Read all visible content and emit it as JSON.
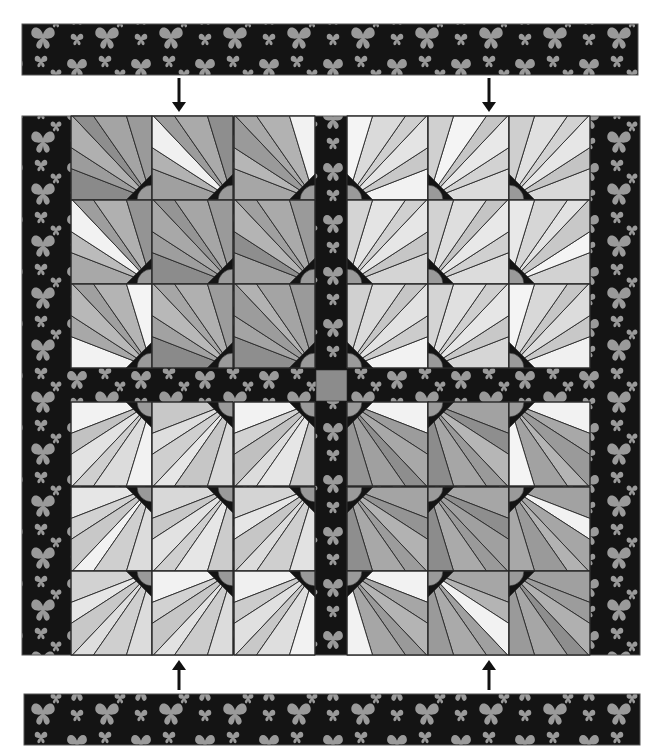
{
  "colors": {
    "background": "#ffffff",
    "fabric_dark": "#141414",
    "butterfly": "#9a9a9a",
    "seam": "#2a2a2a",
    "arrow": "#111111",
    "cornerstone": "#8c8c8c"
  },
  "layout": {
    "top_border_strip": {
      "x": 22,
      "y": 24,
      "w": 616,
      "h": 51
    },
    "bottom_border_strip": {
      "x": 24,
      "y": 694,
      "w": 616,
      "h": 51
    },
    "quilt": {
      "x": 22,
      "y": 116,
      "w": 618,
      "h": 539
    },
    "side_border_left": {
      "x": 22,
      "w": 49
    },
    "side_border_right": {
      "x": 590,
      "w": 50
    },
    "block_cols": [
      71,
      152,
      234,
      347,
      428,
      509
    ],
    "block_rows": [
      116,
      200,
      284,
      402,
      487,
      571
    ],
    "block_w": 81,
    "block_h": 84,
    "vertical_sashing": {
      "x": 315,
      "w": 32
    },
    "horizontal_sashing": {
      "y": 368,
      "h": 34
    },
    "center_cornerstone": {
      "x": 316,
      "y": 370,
      "w": 31,
      "h": 31
    }
  },
  "arrows": [
    {
      "name": "arrow-down-left",
      "direction": "down",
      "x": 179,
      "y1": 78,
      "y2": 112
    },
    {
      "name": "arrow-down-right",
      "direction": "down",
      "x": 489,
      "y1": 78,
      "y2": 112
    },
    {
      "name": "arrow-up-left",
      "direction": "up",
      "x": 179,
      "y1": 690,
      "y2": 660
    },
    {
      "name": "arrow-up-right",
      "direction": "up",
      "x": 489,
      "y1": 690,
      "y2": 660
    }
  ],
  "quadrants": [
    {
      "name": "top-left",
      "origin_corner": "bottom-right",
      "tone": "dark",
      "blocks": [
        [
          "#8a8a8a",
          "#9c9c9c",
          "#b0b0b0",
          "#8e8e8e",
          "#a4a4a4",
          "#9a9a9a"
        ],
        [
          "#a0a0a0",
          "#b2b2b2",
          "#f0f0f0",
          "#9c9c9c",
          "#aaaaaa",
          "#8e8e8e"
        ],
        [
          "#a6a6a6",
          "#b6b6b6",
          "#9a9a9a",
          "#a8a8a8",
          "#b2b2b2",
          "#f2f2f2"
        ],
        [
          "#a8a8a8",
          "#bbbbbb",
          "#f2f2f2",
          "#9e9e9e",
          "#b0b0b0",
          "#949494"
        ],
        [
          "#8c8c8c",
          "#9e9e9e",
          "#a8a8a8",
          "#959595",
          "#a6a6a6",
          "#9a9a9a"
        ],
        [
          "#a2a2a2",
          "#8e8e8e",
          "#b4b4b4",
          "#a0a0a0",
          "#aaaaaa",
          "#9a9a9a"
        ],
        [
          "#f2f2f2",
          "#a8a8a8",
          "#b8b8b8",
          "#a0a0a0",
          "#b4b4b4",
          "#f4f4f4"
        ],
        [
          "#8a8a8a",
          "#a2a2a2",
          "#b8b8b8",
          "#a6a6a6",
          "#b0b0b0",
          "#9c9c9c"
        ],
        [
          "#8e8e8e",
          "#a4a4a4",
          "#9c9c9c",
          "#b2b2b2",
          "#a4a4a4",
          "#9a9a9a"
        ]
      ]
    },
    {
      "name": "top-right",
      "origin_corner": "bottom-left",
      "tone": "light",
      "blocks": [
        [
          "#f2f2f2",
          "#c8c8c8",
          "#e4e4e4",
          "#cfcfcf",
          "#dadada",
          "#f4f4f4"
        ],
        [
          "#dcdcdc",
          "#d2d2d2",
          "#e8e8e8",
          "#c6c6c6",
          "#f4f4f4",
          "#d0d0d0"
        ],
        [
          "#d8d8d8",
          "#c4c4c4",
          "#e6e6e6",
          "#d2d2d2",
          "#e0e0e0",
          "#cfcfcf"
        ],
        [
          "#d4d4d4",
          "#c6c6c6",
          "#e6e6e6",
          "#d0d0d0",
          "#e4e4e4",
          "#d4d4d4"
        ],
        [
          "#dcdcdc",
          "#d0d0d0",
          "#e8e8e8",
          "#c4c4c4",
          "#dedede",
          "#d2d2d2"
        ],
        [
          "#d2d2d2",
          "#f4f4f4",
          "#c8c8c8",
          "#e2e2e2",
          "#d6d6d6",
          "#e8e8e8"
        ],
        [
          "#f2f2f2",
          "#cccccc",
          "#e2e2e2",
          "#c6c6c6",
          "#dadada",
          "#d0d0d0"
        ],
        [
          "#d6d6d6",
          "#c8c8c8",
          "#e6e6e6",
          "#cfcfcf",
          "#e0e0e0",
          "#d4d4d4"
        ],
        [
          "#f0f0f0",
          "#c8c8c8",
          "#dcdcdc",
          "#c6c6c6",
          "#d8d8d8",
          "#f4f4f4"
        ]
      ]
    },
    {
      "name": "bottom-left",
      "origin_corner": "top-right",
      "tone": "light",
      "blocks": [
        [
          "#f2f2f2",
          "#c2c2c2",
          "#e2e2e2",
          "#cfcfcf",
          "#dcdcdc",
          "#f2f2f2"
        ],
        [
          "#c8c8c8",
          "#dedede",
          "#cfcfcf",
          "#e6e6e6",
          "#c6c6c6",
          "#d8d8d8"
        ],
        [
          "#f2f2f2",
          "#d2d2d2",
          "#c0c0c0",
          "#dcdcdc",
          "#e6e6e6",
          "#c8c8c8"
        ],
        [
          "#e6e6e6",
          "#d2d2d2",
          "#c8c8c8",
          "#f2f2f2",
          "#cfcfcf",
          "#dcdcdc"
        ],
        [
          "#d8d8d8",
          "#c8c8c8",
          "#e2e2e2",
          "#cfcfcf",
          "#e6e6e6",
          "#cccccc"
        ],
        [
          "#d4d4d4",
          "#e6e6e6",
          "#c6c6c6",
          "#dcdcdc",
          "#cfcfcf",
          "#e2e2e2"
        ],
        [
          "#d2d2d2",
          "#e6e6e6",
          "#c8c8c8",
          "#dedede",
          "#cfcfcf",
          "#dcdcdc"
        ],
        [
          "#f2f2f2",
          "#d2d2d2",
          "#c6c6c6",
          "#e2e2e2",
          "#cccccc",
          "#dcdcdc"
        ],
        [
          "#f0f0f0",
          "#cccccc",
          "#e0e0e0",
          "#c8c8c8",
          "#dedede",
          "#f2f2f2"
        ]
      ]
    },
    {
      "name": "bottom-right",
      "origin_corner": "top-left",
      "tone": "dark",
      "blocks": [
        [
          "#f2f2f2",
          "#9c9c9c",
          "#a8a8a8",
          "#8e8e8e",
          "#a0a0a0",
          "#959595"
        ],
        [
          "#a2a2a2",
          "#8e8e8e",
          "#b6b6b6",
          "#9a9a9a",
          "#a6a6a6",
          "#8c8c8c"
        ],
        [
          "#f2f2f2",
          "#a8a8a8",
          "#9a9a9a",
          "#b4b4b4",
          "#a2a2a2",
          "#f4f4f4"
        ],
        [
          "#a4a4a4",
          "#949494",
          "#b2b2b2",
          "#9c9c9c",
          "#a8a8a8",
          "#8e8e8e"
        ],
        [
          "#a6a6a6",
          "#8e8e8e",
          "#a0a0a0",
          "#9a9a9a",
          "#aaaaaa",
          "#8c8c8c"
        ],
        [
          "#a2a2a2",
          "#f2f2f2",
          "#a6a6a6",
          "#b2b2b2",
          "#9a9a9a",
          "#a8a8a8"
        ],
        [
          "#f2f2f2",
          "#a6a6a6",
          "#b4b4b4",
          "#9a9a9a",
          "#a6a6a6",
          "#f2f2f2"
        ],
        [
          "#a6a6a6",
          "#b4b4b4",
          "#f2f2f2",
          "#a0a0a0",
          "#aaaaaa",
          "#9a9a9a"
        ],
        [
          "#a0a0a0",
          "#9c9c9c",
          "#b0b0b0",
          "#8e8e8e",
          "#a6a6a6",
          "#9a9a9a"
        ]
      ]
    }
  ]
}
